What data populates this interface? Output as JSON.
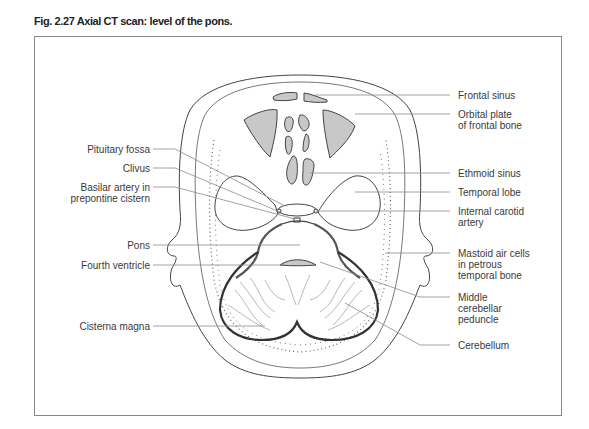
{
  "figure": {
    "title": "Fig. 2.27  Axial CT scan: level of the pons."
  },
  "colors": {
    "fill_gray": "#c8c8c8",
    "outline": "#444444",
    "leader": "#8a8a8a",
    "frame": "#888888"
  },
  "labels": {
    "left": [
      {
        "id": "pituitary-fossa",
        "lines": [
          "Pituitary fossa"
        ]
      },
      {
        "id": "clivus",
        "lines": [
          "Clivus"
        ]
      },
      {
        "id": "basilar-artery",
        "lines": [
          "Basilar artery in",
          "prepontine cistern"
        ]
      },
      {
        "id": "pons",
        "lines": [
          "Pons"
        ]
      },
      {
        "id": "fourth-ventricle",
        "lines": [
          "Fourth ventricle"
        ]
      },
      {
        "id": "cisterna-magna",
        "lines": [
          "Cisterna magna"
        ]
      }
    ],
    "right": [
      {
        "id": "frontal-sinus",
        "lines": [
          "Frontal sinus"
        ]
      },
      {
        "id": "orbital-plate",
        "lines": [
          "Orbital plate",
          "of frontal bone"
        ]
      },
      {
        "id": "ethmoid-sinus",
        "lines": [
          "Ethmoid sinus"
        ]
      },
      {
        "id": "temporal-lobe",
        "lines": [
          "Temporal lobe"
        ]
      },
      {
        "id": "internal-carotid",
        "lines": [
          "Internal carotid",
          "artery"
        ]
      },
      {
        "id": "mastoid-air-cells",
        "lines": [
          "Mastoid air cells",
          "in petrous",
          "temporal bone"
        ]
      },
      {
        "id": "middle-cerebellar-peduncle",
        "lines": [
          "Middle",
          "cerebellar",
          "peduncle"
        ]
      },
      {
        "id": "cerebellum",
        "lines": [
          "Cerebellum"
        ]
      }
    ]
  },
  "text": {
    "l0a": "Pituitary fossa",
    "l1a": "Clivus",
    "l2a": "Basilar artery in",
    "l2b": "prepontine cistern",
    "l3a": "Pons",
    "l4a": "Fourth ventricle",
    "l5a": "Cisterna magna",
    "r0a": "Frontal sinus",
    "r1a": "Orbital plate",
    "r1b": "of frontal bone",
    "r2a": "Ethmoid sinus",
    "r3a": "Temporal lobe",
    "r4a": "Internal carotid",
    "r4b": "artery",
    "r5a": "Mastoid air cells",
    "r5b": "in petrous",
    "r5c": "temporal bone",
    "r6a": "Middle",
    "r6b": "cerebellar",
    "r6c": "peduncle",
    "r7a": "Cerebellum"
  }
}
